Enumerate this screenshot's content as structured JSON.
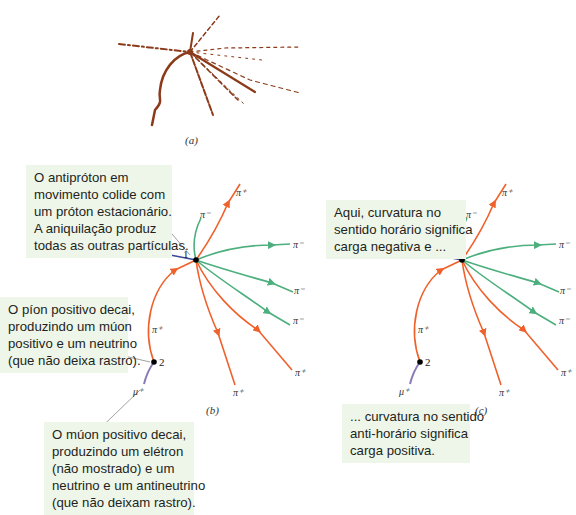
{
  "panel_a": {
    "caption": "(a)",
    "description": "bubble-chamber photograph of antiproton-proton annihilation tracks"
  },
  "panel_b": {
    "caption": "(b)",
    "vertex_labels": [
      "1",
      "2"
    ],
    "particles": {
      "incoming": "p̄",
      "pi_minus": "π⁻",
      "pi_plus": "π⁺",
      "mu_plus": "μ⁺"
    },
    "callouts": [
      {
        "id": "annihilation",
        "lines": [
          "O antipróton em",
          "movimento colide com",
          "um próton estacionário.",
          "A aniquilação produz",
          "todas as outras partículas."
        ]
      },
      {
        "id": "pion-decay",
        "lines": [
          "O píon positivo decai,",
          "produzindo um múon",
          "positivo e um neutrino",
          "(que não deixa rastro)."
        ]
      },
      {
        "id": "muon-decay",
        "lines": [
          "O múon positivo decai,",
          "produzindo um elétron",
          "(não mostrado) e um",
          "neutrino e um antineutrino",
          "(que não deixam rastro)."
        ]
      }
    ]
  },
  "panel_c": {
    "caption": "(c)",
    "callouts": [
      {
        "id": "clockwise",
        "lines": [
          "Aqui, curvatura no",
          "sentido horário significa",
          "carga negativa e ..."
        ]
      },
      {
        "id": "counterclockwise",
        "lines": [
          "... curvatura no sentido",
          "anti-horário significa",
          "carga positiva."
        ]
      }
    ]
  },
  "colors": {
    "antiproton": "#3b4a9a",
    "negative": "#4caf7d",
    "positive": "#f0602a",
    "muon": "#8a7ab8",
    "photo_track": "#8b3a1a",
    "callout_bg": "#eef6ea"
  }
}
